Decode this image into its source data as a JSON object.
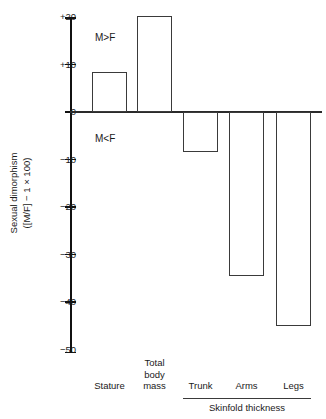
{
  "chart_data": {
    "type": "bar",
    "title": "",
    "xlabel": "",
    "ylabel": "Sexual dimorphism ([M/F] − 1 × 100)",
    "ylabel_line1": "Sexual dimorphism",
    "ylabel_line2": "([M/F] − 1 × 100)",
    "categories": [
      "Stature",
      "Total body mass",
      "Trunk",
      "Arms",
      "Legs"
    ],
    "values": [
      8.4,
      20.2,
      -8.4,
      -34.5,
      -45
    ],
    "ylim": [
      -50,
      20
    ],
    "grid": false,
    "legend": "none",
    "yticks": [
      {
        "value": 20,
        "label": "+20"
      },
      {
        "value": 10,
        "label": "+10"
      },
      {
        "value": 0,
        "label": "0"
      },
      {
        "value": -10,
        "label": "−10"
      },
      {
        "value": -20,
        "label": "−20"
      },
      {
        "value": -30,
        "label": "−30"
      },
      {
        "value": -40,
        "label": "−40"
      },
      {
        "value": -50,
        "label": "−50"
      }
    ],
    "annotations": [
      {
        "name": "male-greater-than-female",
        "text": "M>F"
      },
      {
        "name": "male-less-than-female",
        "text": "M<F"
      }
    ],
    "category_labels": [
      {
        "name": "stature",
        "lines": [
          "Stature"
        ]
      },
      {
        "name": "total-body-mass",
        "lines": [
          "Total",
          "body",
          "mass"
        ]
      },
      {
        "name": "trunk",
        "lines": [
          "Trunk"
        ]
      },
      {
        "name": "arms",
        "lines": [
          "Arms"
        ]
      },
      {
        "name": "legs",
        "lines": [
          "Legs"
        ]
      }
    ],
    "group": {
      "label": "Skinfold thickness",
      "members": [
        "Trunk",
        "Arms",
        "Legs"
      ]
    },
    "colors": {
      "bar_fill": "#ffffff",
      "bar_stroke": "#3a3a3a",
      "axis": "#111111",
      "text": "#1a1a1a"
    }
  }
}
